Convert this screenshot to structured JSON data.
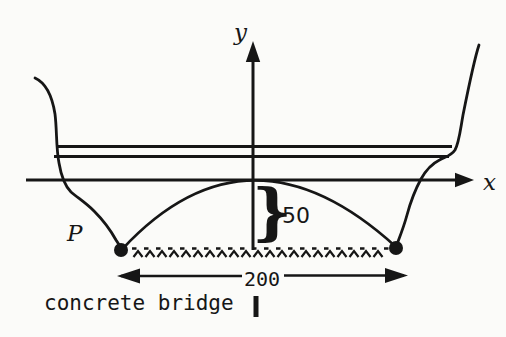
{
  "figure": {
    "y_axis_label": "y",
    "x_axis_label": "x",
    "point_label": "P",
    "depth_brace_glyph": "}",
    "depth_value": "50",
    "span_value": "200",
    "caption": "concrete bridge"
  },
  "dimensions": {
    "bridge_span": 200,
    "arch_depth_below_axis": 50
  },
  "colors": {
    "ink": "#161616",
    "paper": "#fbfbf9"
  }
}
